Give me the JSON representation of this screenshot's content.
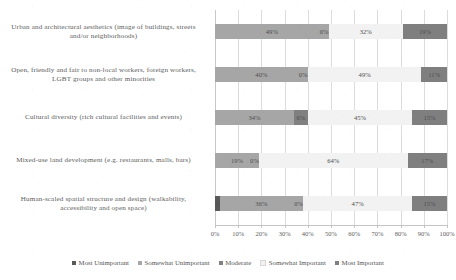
{
  "chart_data": {
    "type": "bar",
    "orientation": "horizontal",
    "stacked": true,
    "normalized_percent": true,
    "title": "",
    "subtitle": "",
    "xlabel": "",
    "ylabel": "",
    "xlim": [
      0,
      100
    ],
    "xtick_step": 10,
    "grid": true,
    "legend_position": "bottom",
    "xticks": [
      "0%",
      "10%",
      "20%",
      "30%",
      "40%",
      "50%",
      "60%",
      "70%",
      "80%",
      "90%",
      "100%"
    ],
    "categories": [
      "Urban and architectural aesthetics (image of buildings, streets and/or neighborhoods)",
      "Open, friendly and fair to non-local workers, foreign workers, LGBT groups and other minorities",
      "Cultural diversity (rich cultural facilities and events)",
      "Mixed-use land development (e.g. restaurants, malls, bars)",
      "Human-scaled spatial structure and design (walkability, accessibility and open space)"
    ],
    "series": [
      {
        "name": "Most Unimportant",
        "color": "#595959",
        "values": [
          0,
          0,
          0,
          0,
          2
        ],
        "labels": [
          "0%",
          "0%",
          "0%",
          "0%",
          "2%"
        ]
      },
      {
        "name": "Somewhat Unimportant",
        "color": "#a6a6a6",
        "values": [
          49,
          40,
          34,
          19,
          36
        ],
        "labels": [
          "49%",
          "40%",
          "34%",
          "19%",
          "36%"
        ]
      },
      {
        "name": "Moderate",
        "color": "#808080",
        "values": [
          0,
          0,
          6,
          0,
          0
        ],
        "labels": [
          "0%",
          "0%",
          "6%",
          "0%",
          "0%"
        ]
      },
      {
        "name": "Somewhat Important",
        "color": "#f2f2f2",
        "values": [
          32,
          49,
          45,
          64,
          47
        ],
        "labels": [
          "32%",
          "49%",
          "45%",
          "64%",
          "47%"
        ]
      },
      {
        "name": "Most Important",
        "color": "#7f7f7f",
        "values": [
          19,
          11,
          15,
          17,
          15
        ],
        "labels": [
          "19%",
          "11%",
          "15%",
          "17%",
          "15%"
        ]
      }
    ]
  },
  "legend": {
    "items": [
      {
        "label": "Most Unimportant",
        "color": "#595959"
      },
      {
        "label": "Somewhat Unimportant",
        "color": "#a6a6a6"
      },
      {
        "label": "Moderate",
        "color": "#808080"
      },
      {
        "label": "Somewhat Important",
        "color": "#f2f2f2"
      },
      {
        "label": "Most Important",
        "color": "#7f7f7f"
      }
    ]
  },
  "colors": {
    "gridline": "#dcdcdc",
    "axis": "#c4c4c4",
    "text": "#565656",
    "background": "#ffffff"
  }
}
